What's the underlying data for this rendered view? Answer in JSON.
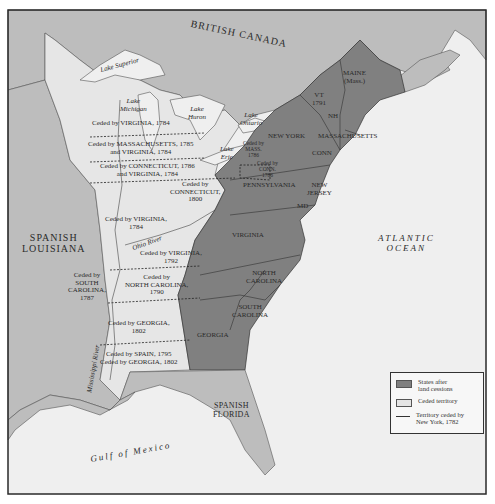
{
  "map": {
    "colors": {
      "water": "#efefef",
      "foreign_land": "#b8b8b8",
      "ceded_territory": "#e4e4e4",
      "states": "#7f7f7f",
      "frame": "#2a2a2a"
    },
    "regions": {
      "british_canada": "BRITISH CANADA",
      "spanish_louisiana": "SPANISH LOUISIANA",
      "spanish_florida": "SPANISH FLORIDA",
      "atlantic": "ATLANTIC",
      "ocean": "OCEAN",
      "gulf": "Gulf of Mexico"
    },
    "spanish_louisiana": {
      "line1": "SPANISH",
      "line2": "LOUISIANA"
    },
    "spanish_florida": {
      "line1": "SPANISH",
      "line2": "FLORIDA"
    },
    "lakes": {
      "superior": "Lake Superior",
      "michigan_1": "Lake",
      "michigan_2": "Michigan",
      "huron_1": "Lake",
      "huron_2": "Huron",
      "ontario_1": "Lake",
      "ontario_2": "Ontario",
      "erie_1": "Lake",
      "erie_2": "Erie"
    },
    "rivers": {
      "ohio": "Ohio River",
      "mississippi": "Mississippi River"
    },
    "states": {
      "maine_1": "MAINE",
      "maine_2": "(Mass.)",
      "vt_1": "VT",
      "vt_2": "1791",
      "nh": "NH",
      "massachusetts": "MASSACHUSETTS",
      "new_york": "NEW YORK",
      "conn": "CONN",
      "pennsylvania": "PENNSYLVANIA",
      "new_jersey_1": "NEW",
      "new_jersey_2": "JERSEY",
      "md": "MD",
      "virginia": "VIRGINIA",
      "north_carolina_1": "NORTH",
      "north_carolina_2": "CAROLINA",
      "south_carolina_1": "SOUTH",
      "south_carolina_2": "CAROLINA",
      "georgia": "GEORGIA",
      "ceded_mass_1": "Ceded by",
      "ceded_mass_2": "MASS.",
      "ceded_mass_3": "1786",
      "ceded_conn_1": "Ceded by",
      "ceded_conn_2": "CONN.",
      "ceded_conn_3": "1786"
    },
    "cessions": [
      {
        "line1": "Ceded by VIRGINIA, 1784",
        "line2": ""
      },
      {
        "line1": "Ceded by MASSACHUSETTS, 1785",
        "line2": "and VIRGINIA, 1784"
      },
      {
        "line1": "Ceded by CONNECTICUT, 1786",
        "line2": "and VIRGINIA, 1784"
      },
      {
        "line1": "Ceded by",
        "line2": "CONNECTICUT,",
        "line3": "1800"
      },
      {
        "line1": "Ceded by VIRGINIA,",
        "line2": "1784"
      },
      {
        "line1": "Ceded by VIRGINIA,",
        "line2": "1792"
      },
      {
        "line1": "Ceded by",
        "line2": "NORTH CAROLINA,",
        "line3": "1790"
      },
      {
        "line1": "Ceded by",
        "line2": "SOUTH",
        "line3": "CAROLINA,",
        "line4": "1787"
      },
      {
        "line1": "Ceded by GEORGIA,",
        "line2": "1802"
      },
      {
        "line1": "Ceded by SPAIN, 1795",
        "line2": "Ceded by GEORGIA, 1802"
      }
    ]
  },
  "legend": {
    "items": [
      {
        "label_1": "States after",
        "label_2": "land cessions",
        "color": "#7f7f7f"
      },
      {
        "label_1": "Ceded territory",
        "label_2": "",
        "color": "#e4e4e4"
      },
      {
        "label_1": "Territory ceded by",
        "label_2": "New York, 1782",
        "style": "line"
      }
    ]
  }
}
